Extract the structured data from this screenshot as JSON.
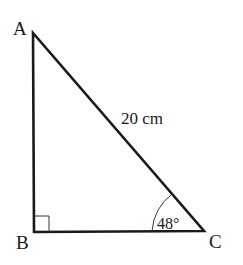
{
  "diagram": {
    "type": "right-triangle",
    "vertices": {
      "A": {
        "label": "A",
        "x": 33,
        "y": 33
      },
      "B": {
        "label": "B",
        "x": 34,
        "y": 232
      },
      "C": {
        "label": "C",
        "x": 204,
        "y": 231
      }
    },
    "hypotenuse_label": "20 cm",
    "angle_label": "48°",
    "right_angle_at": "B",
    "colors": {
      "stroke": "#1a1a1a",
      "background": "#ffffff"
    }
  }
}
